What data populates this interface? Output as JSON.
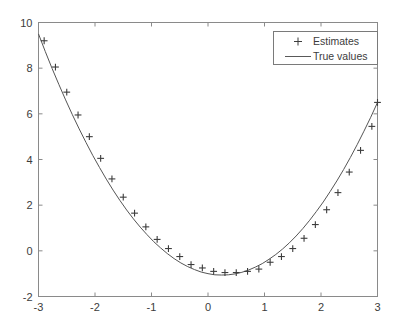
{
  "chart_data": {
    "type": "scatter",
    "title": "",
    "xlabel": "",
    "ylabel": "",
    "xlim": [
      -3,
      3
    ],
    "ylim": [
      -2,
      10
    ],
    "xticks": [
      -3,
      -2,
      -1,
      0,
      1,
      2,
      3
    ],
    "yticks": [
      -2,
      0,
      2,
      4,
      6,
      8,
      10
    ],
    "xticklabels": [
      "-3",
      "-2",
      "-1",
      "0",
      "1",
      "2",
      "3"
    ],
    "yticklabels": [
      "-2",
      "0",
      "2",
      "4",
      "6",
      "8",
      "10"
    ],
    "grid": false,
    "box": true,
    "legend": {
      "position": "upper-right",
      "entries": [
        {
          "label": "Estimates",
          "marker": "plus",
          "style": "marker"
        },
        {
          "label": "True values",
          "marker": "line",
          "style": "line"
        }
      ]
    },
    "series": [
      {
        "name": "True values",
        "style": "line",
        "color": "#555555",
        "formula": "y = x^2 - 0.5x - 1",
        "x": [
          -3.0,
          -2.88,
          -2.76,
          -2.64,
          -2.52,
          -2.4,
          -2.28,
          -2.16,
          -2.04,
          -1.92,
          -1.8,
          -1.68,
          -1.56,
          -1.44,
          -1.32,
          -1.2,
          -1.08,
          -0.96,
          -0.84,
          -0.72,
          -0.6,
          -0.48,
          -0.36,
          -0.24,
          -0.12,
          0.0,
          0.12,
          0.24,
          0.36,
          0.48,
          0.6,
          0.72,
          0.84,
          0.96,
          1.08,
          1.2,
          1.32,
          1.44,
          1.56,
          1.68,
          1.8,
          1.92,
          2.04,
          2.16,
          2.28,
          2.4,
          2.52,
          2.64,
          2.76,
          2.88,
          3.0
        ],
        "y": [
          9.5,
          8.73,
          7.99,
          7.29,
          6.61,
          5.96,
          5.34,
          4.75,
          4.18,
          3.65,
          3.14,
          2.66,
          2.21,
          1.79,
          1.4,
          1.04,
          0.71,
          0.4,
          0.13,
          -0.12,
          -0.34,
          -0.53,
          -0.69,
          -0.82,
          -0.93,
          -1.0,
          -1.05,
          -1.06,
          -1.05,
          -1.01,
          -0.94,
          -0.84,
          -0.71,
          -0.56,
          -0.37,
          -0.16,
          0.08,
          0.35,
          0.65,
          0.98,
          1.34,
          1.73,
          2.14,
          2.59,
          3.06,
          3.56,
          4.09,
          4.65,
          5.24,
          5.85,
          6.5
        ]
      },
      {
        "name": "Estimates",
        "style": "marker",
        "marker": "plus",
        "color": "#3d3d3d",
        "x": [
          -2.9,
          -2.7,
          -2.5,
          -2.3,
          -2.1,
          -1.9,
          -1.7,
          -1.5,
          -1.3,
          -1.1,
          -0.9,
          -0.7,
          -0.5,
          -0.3,
          -0.1,
          0.1,
          0.3,
          0.5,
          0.7,
          0.9,
          1.1,
          1.3,
          1.5,
          1.7,
          1.9,
          2.1,
          2.3,
          2.5,
          2.7,
          2.9,
          3.0
        ],
        "y": [
          9.2,
          8.05,
          6.95,
          5.95,
          5.0,
          4.05,
          3.15,
          2.35,
          1.65,
          1.05,
          0.5,
          0.1,
          -0.25,
          -0.6,
          -0.75,
          -0.9,
          -0.95,
          -0.95,
          -0.9,
          -0.8,
          -0.5,
          -0.25,
          0.1,
          0.55,
          1.15,
          1.8,
          2.55,
          3.45,
          4.4,
          5.45,
          6.5
        ]
      }
    ]
  },
  "axes": {
    "x_tick_labels": [
      "-3",
      "-2",
      "-1",
      "0",
      "1",
      "2",
      "3"
    ],
    "y_tick_labels": [
      "10",
      "8",
      "6",
      "4",
      "2",
      "0",
      "-2"
    ]
  },
  "legend": {
    "estimates_label": "Estimates",
    "true_values_label": "True values"
  },
  "colors": {
    "background": "#ffffff",
    "axis": "#8a8a8a",
    "line": "#595959",
    "marker": "#3d3d3d",
    "text": "#3c3c3c",
    "legend_border": "#7a7a7a"
  }
}
